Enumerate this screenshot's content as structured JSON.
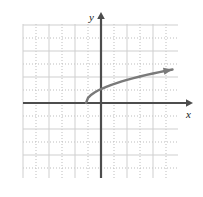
{
  "figure": {
    "name": "square-root-function-graph",
    "background_color": "#ffffff"
  },
  "axes": {
    "x_axis_label": "x",
    "y_axis_label": "y",
    "axis_color": "#4d4d4d",
    "origin_px": {
      "x": 101,
      "y": 103
    }
  },
  "grid": {
    "major_color": "#cfcfcf",
    "minor_color": "#bdbdbd",
    "cell_size_px": 13,
    "area_px": {
      "left": 23,
      "top": 24,
      "right": 178,
      "bottom": 178
    }
  },
  "chart_data": {
    "type": "line",
    "title": "",
    "xlabel": "x",
    "ylabel": "y",
    "grid": true,
    "legend": null,
    "curve_color": "#7a7a7a",
    "xlim": [
      -6,
      6
    ],
    "ylim": [
      -5.8,
      6.1
    ],
    "series": [
      {
        "name": "square-root-curve",
        "equation": "y = sqrt(x + 1.15)",
        "arrow_end": "right",
        "x": [
          -1.15,
          -1.0,
          -0.8,
          -0.5,
          -0.2,
          0.0,
          0.4,
          0.8,
          1.2,
          1.6,
          2.0,
          2.5,
          3.0,
          3.5,
          4.0,
          4.5,
          5.0,
          5.5
        ],
        "y": [
          0.0,
          0.39,
          0.59,
          0.81,
          0.98,
          1.07,
          1.24,
          1.4,
          1.53,
          1.66,
          1.78,
          1.91,
          2.04,
          2.16,
          2.27,
          2.37,
          2.48,
          2.58
        ]
      }
    ]
  }
}
